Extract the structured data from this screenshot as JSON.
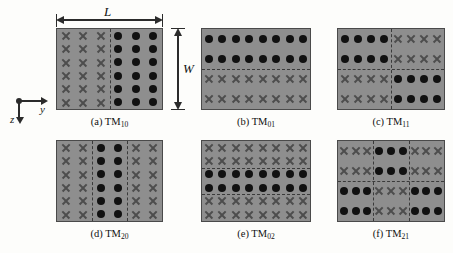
{
  "figure": {
    "background_color": "#fdfdfb",
    "panel_fill_color": "#8e8e8e",
    "panel_border_color": "#4a4a4a",
    "dot_color": "#111111",
    "cross_color": "#4d4d4d",
    "nodal_line_color": "#3a3a3a"
  },
  "axis_widget": {
    "y_label": "y",
    "z_label": "z",
    "origin_name": "x-out-of-page-origin"
  },
  "dimensions": {
    "length_label": "L",
    "width_label": "W"
  },
  "panels": [
    {
      "id": "a",
      "caption_prefix": "(a) TM",
      "caption_subscript": "10",
      "mode": "TM10",
      "cols": 2,
      "rows": 1,
      "glyph_cols": 3,
      "glyph_rows": 6,
      "pattern": [
        [
          "cross",
          "dot"
        ]
      ],
      "vertical_nodal_lines": 1,
      "horizontal_nodal_lines": 0
    },
    {
      "id": "b",
      "caption_prefix": "(b) TM",
      "caption_subscript": "01",
      "mode": "TM01",
      "cols": 1,
      "rows": 2,
      "glyph_cols": 8,
      "glyph_rows": 2,
      "pattern": [
        [
          "dot"
        ],
        [
          "cross"
        ]
      ],
      "vertical_nodal_lines": 0,
      "horizontal_nodal_lines": 1
    },
    {
      "id": "c",
      "caption_prefix": "(c) TM",
      "caption_subscript": "11",
      "mode": "TM11",
      "cols": 2,
      "rows": 2,
      "glyph_cols": 4,
      "glyph_rows": 2,
      "pattern": [
        [
          "dot",
          "cross"
        ],
        [
          "cross",
          "dot"
        ]
      ],
      "vertical_nodal_lines": 1,
      "horizontal_nodal_lines": 1
    },
    {
      "id": "d",
      "caption_prefix": "(d) TM",
      "caption_subscript": "20",
      "mode": "TM20",
      "cols": 3,
      "rows": 1,
      "glyph_cols": 2,
      "glyph_rows": 6,
      "pattern": [
        [
          "cross",
          "dot",
          "cross"
        ]
      ],
      "vertical_nodal_lines": 2,
      "horizontal_nodal_lines": 0
    },
    {
      "id": "e",
      "caption_prefix": "(e) TM",
      "caption_subscript": "02",
      "mode": "TM02",
      "cols": 1,
      "rows": 3,
      "glyph_cols": 8,
      "glyph_rows": 2,
      "pattern": [
        [
          "cross"
        ],
        [
          "dot"
        ],
        [
          "cross"
        ]
      ],
      "vertical_nodal_lines": 0,
      "horizontal_nodal_lines": 2
    },
    {
      "id": "f",
      "caption_prefix": "(f) TM",
      "caption_subscript": "21",
      "mode": "TM21",
      "cols": 3,
      "rows": 2,
      "glyph_cols": 3,
      "glyph_rows": 2,
      "pattern": [
        [
          "cross",
          "dot",
          "cross"
        ],
        [
          "dot",
          "cross",
          "dot"
        ]
      ],
      "vertical_nodal_lines": 2,
      "horizontal_nodal_lines": 1
    }
  ]
}
